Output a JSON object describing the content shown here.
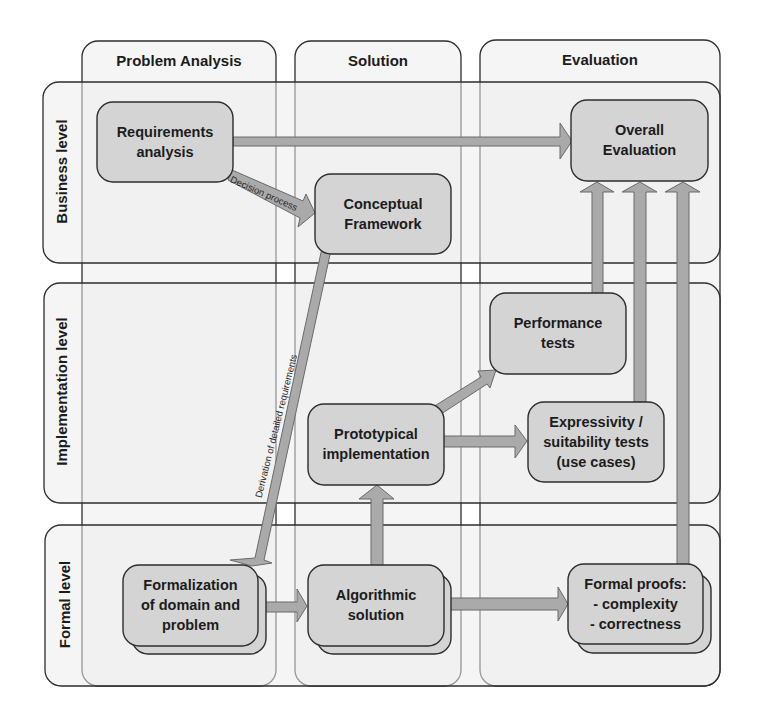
{
  "diagram": {
    "columns": [
      {
        "id": "problem-analysis",
        "label": "Problem Analysis"
      },
      {
        "id": "solution",
        "label": "Solution"
      },
      {
        "id": "evaluation",
        "label": "Evaluation"
      }
    ],
    "rows": [
      {
        "id": "business",
        "label": "Business level"
      },
      {
        "id": "implementation",
        "label": "Implementation level"
      },
      {
        "id": "formal",
        "label": "Formal level"
      }
    ],
    "nodes": {
      "requirements_analysis": "Requirements\nanalysis",
      "conceptual_framework": "Conceptual\nFramework",
      "overall_evaluation": "Overall\nEvaluation",
      "performance_tests": "Performance\ntests",
      "prototypical_implementation": "Prototypical\nimplementation",
      "expressivity_tests": "Expressivity /\nsuitability tests\n(use cases)",
      "formalization": "Formalization\nof domain and\nproblem",
      "algorithmic_solution": "Algorithmic\nsolution",
      "formal_proofs": "Formal proofs:\n- complexity\n- correctness"
    },
    "edges": {
      "decision_process": "Decision process",
      "derivation": "Derivation of detailed requirements"
    },
    "colors": {
      "node_fill": "#d4d4d4",
      "lane_fill": "#ececec",
      "arrow_fill": "#aaaaaa",
      "stroke": "#2d2d2d"
    }
  }
}
